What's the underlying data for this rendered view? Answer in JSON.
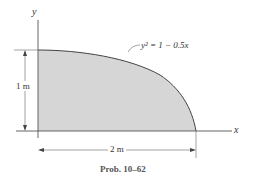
{
  "figure": {
    "axis_labels": {
      "y": "y",
      "x": "x"
    },
    "curve_equation": "y² = 1 − 0.5x",
    "dimensions": {
      "height": "1 m",
      "width": "2 m"
    },
    "caption": "Prob. 10–62",
    "colors": {
      "fill": "#d6d6d6",
      "stroke": "#444444",
      "text": "#333333"
    }
  }
}
